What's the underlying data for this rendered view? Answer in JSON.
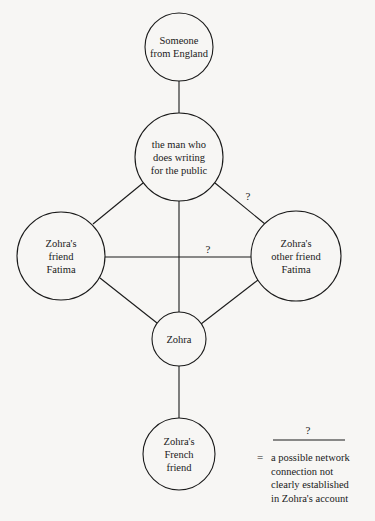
{
  "diagram": {
    "nodes": [
      {
        "id": "england",
        "label": "Someone from England",
        "lines": [
          "Someone",
          "from England"
        ],
        "cx": 179,
        "cy": 47,
        "r": 34
      },
      {
        "id": "writer",
        "label": "the man who does writing for the public",
        "lines": [
          "the man who",
          "does writing",
          "for the public"
        ],
        "cx": 179,
        "cy": 157,
        "r": 44
      },
      {
        "id": "fatima1",
        "label": "Zohra's friend Fatima",
        "lines": [
          "Zohra's",
          "friend",
          "Fatima"
        ],
        "cx": 61,
        "cy": 256,
        "r": 44
      },
      {
        "id": "fatima2",
        "label": "Zohra's other friend Fatima",
        "lines": [
          "Zohra's",
          "other friend",
          "Fatima"
        ],
        "cx": 296,
        "cy": 256,
        "r": 45
      },
      {
        "id": "zohra",
        "label": "Zohra",
        "lines": [
          "Zohra"
        ],
        "cx": 179,
        "cy": 339,
        "r": 27
      },
      {
        "id": "french",
        "label": "Zohra's French friend",
        "lines": [
          "Zohra's",
          "French",
          "friend"
        ],
        "cx": 179,
        "cy": 454,
        "r": 36
      }
    ],
    "edges": [
      {
        "from": "england",
        "to": "writer",
        "uncertain": false
      },
      {
        "from": "writer",
        "to": "fatima1",
        "uncertain": false
      },
      {
        "from": "writer",
        "to": "fatima2",
        "uncertain": true,
        "label": "?"
      },
      {
        "from": "writer",
        "to": "zohra",
        "uncertain": false
      },
      {
        "from": "fatima1",
        "to": "fatima2",
        "uncertain": true,
        "label": "?"
      },
      {
        "from": "fatima1",
        "to": "zohra",
        "uncertain": false
      },
      {
        "from": "fatima2",
        "to": "zohra",
        "uncertain": false
      },
      {
        "from": "zohra",
        "to": "french",
        "uncertain": false
      }
    ],
    "edge_labels": {
      "writer_fatima2": "?",
      "fatima1_fatima2": "?"
    },
    "legend": {
      "symbol": "?",
      "equals": "=",
      "lines": [
        "a possible network",
        "connection not",
        "clearly established",
        "in Zohra's account"
      ]
    }
  }
}
